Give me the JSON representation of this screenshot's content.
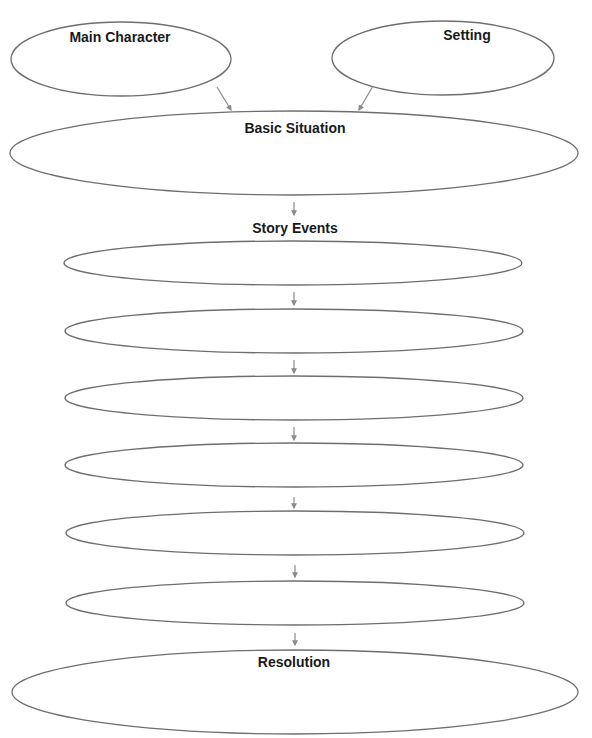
{
  "diagram": {
    "type": "story-map",
    "stroke_color": "#6e6e6e",
    "arrow_color": "#8a8a8a",
    "nodes": {
      "main_character": {
        "label": "Main Character",
        "value": ""
      },
      "setting": {
        "label": "Setting",
        "value": ""
      },
      "basic_situation": {
        "label": "Basic Situation",
        "value": ""
      },
      "story_events": {
        "label": "Story Events",
        "events": [
          {
            "index": 1,
            "value": ""
          },
          {
            "index": 2,
            "value": ""
          },
          {
            "index": 3,
            "value": ""
          },
          {
            "index": 4,
            "value": ""
          },
          {
            "index": 5,
            "value": ""
          },
          {
            "index": 6,
            "value": ""
          }
        ]
      },
      "resolution": {
        "label": "Resolution",
        "value": ""
      }
    },
    "edges": [
      {
        "from": "Main Character",
        "to": "Basic Situation"
      },
      {
        "from": "Setting",
        "to": "Basic Situation"
      },
      {
        "from": "Basic Situation",
        "to": "Story Events"
      },
      {
        "from": "Event 1",
        "to": "Event 2"
      },
      {
        "from": "Event 2",
        "to": "Event 3"
      },
      {
        "from": "Event 3",
        "to": "Event 4"
      },
      {
        "from": "Event 4",
        "to": "Event 5"
      },
      {
        "from": "Event 5",
        "to": "Event 6"
      },
      {
        "from": "Event 6",
        "to": "Resolution"
      }
    ]
  }
}
